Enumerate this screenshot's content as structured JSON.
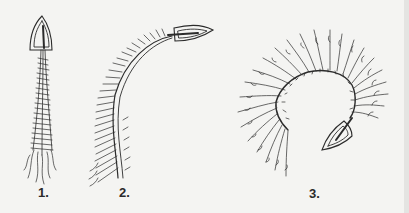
{
  "figure": {
    "panels": [
      {
        "label": "1.",
        "description": "iron pointing up with a straight vertical trailing strand"
      },
      {
        "label": "2.",
        "description": "iron pointing right with a curved arching trailing strand"
      },
      {
        "label": "3.",
        "description": "iron pointing down-left at the end of a spiral with fanned branches"
      }
    ]
  },
  "colors": {
    "ink": "#2b2b2b",
    "paper": "#f4f4f2"
  }
}
